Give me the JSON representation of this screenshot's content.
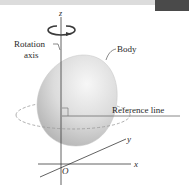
{
  "figure": {
    "labels": {
      "z_axis": "z",
      "x_axis": "x",
      "y_axis": "y",
      "origin": "O",
      "rotation_axis_line1": "Rotation",
      "rotation_axis_line2": "axis",
      "body": "Body",
      "reference_line": "Reference line"
    },
    "colors": {
      "axis": "#3a3a3a",
      "body_light": "#f2f2f2",
      "body_dark": "#b9b9b9",
      "dashed_path": "#9a9a9a",
      "reference_line": "#7a7a7a",
      "header_strip": "#d8d8d8",
      "header_box": "#4a4a4a"
    }
  }
}
